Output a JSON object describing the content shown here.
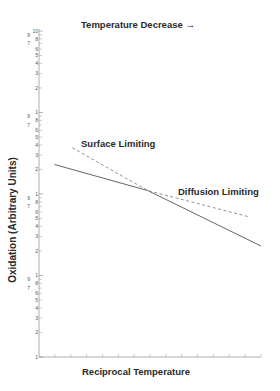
{
  "chart_data": {
    "type": "line",
    "title": "Temperature Decrease →",
    "xlabel": "Reciprocal Temperature",
    "ylabel": "Oxidation (Arbitrary Units)",
    "y_scale": "log",
    "ylim": [
      1,
      10000
    ],
    "y_decades": 4,
    "y_decade_labels": [
      "10",
      "1",
      "1",
      "1",
      "1"
    ],
    "y_minor_tick_labels": [
      "9",
      "8",
      "7",
      "6",
      "5",
      "4",
      "3",
      "2"
    ],
    "x_ticks": 14,
    "grid": false,
    "legend": "none",
    "annotations": [
      "Surface Limiting",
      "Diffusion Limiting"
    ],
    "series": [
      {
        "name": "Observed oxidation",
        "style": "solid",
        "points": [
          [
            0.07,
            230
          ],
          [
            0.49,
            110
          ],
          [
            1.0,
            23
          ]
        ]
      },
      {
        "name": "Surface/Diffusion limiting extrapolation",
        "style": "dashed",
        "points": [
          [
            0.15,
            370
          ],
          [
            0.49,
            110
          ],
          [
            0.94,
            53
          ]
        ]
      }
    ]
  },
  "labels": {
    "title": "Temperature Decrease →",
    "ylabel": "Oxidation (Arbitrary Units)",
    "xlabel": "Reciprocal Temperature",
    "surface": "Surface Limiting",
    "diffusion": "Diffusion Limiting"
  }
}
